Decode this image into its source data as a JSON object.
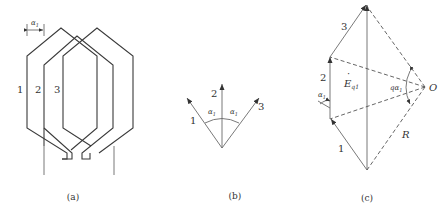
{
  "figure": {
    "panels": [
      {
        "id": "a",
        "caption": "(a)",
        "description": "Three overlapping hexagonal coils spaced by slot angle",
        "coil_labels": [
          "1",
          "2",
          "3"
        ],
        "spacing_label": "α",
        "spacing_sub": "1"
      },
      {
        "id": "b",
        "caption": "(b)",
        "description": "Three coil EMF phasors separated by angle α1",
        "phasor_labels": [
          "1",
          "2",
          "3"
        ],
        "angle_label": "α",
        "angle_sub": "1"
      },
      {
        "id": "c",
        "caption": "(c)",
        "description": "Phasor sum of coil EMFs forming polygon inscribed in circle of radius R centered at O",
        "phasor_labels": [
          "1",
          "2",
          "3"
        ],
        "resultant_label": "E",
        "resultant_sub": "q1",
        "angle_label": "α",
        "angle_sub": "1",
        "center_angle_prefix": "q",
        "center_angle_label": "α",
        "center_angle_sub": "1",
        "center_label": "O",
        "radius_label": "R"
      }
    ]
  }
}
